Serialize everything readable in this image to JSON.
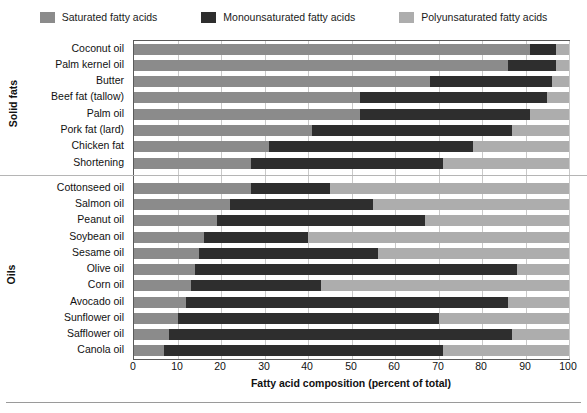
{
  "legend": {
    "position": "top",
    "items": [
      {
        "label": "Saturated fatty acids",
        "color": "#8b8b8b",
        "key": "saturated"
      },
      {
        "label": "Monounsaturated fatty acids",
        "color": "#2e2e2e",
        "key": "monounsaturated"
      },
      {
        "label": "Polyunsaturated fatty acids",
        "color": "#adadad",
        "key": "polyunsaturated"
      }
    ]
  },
  "groups": [
    {
      "name": "Solid fats",
      "count": 8
    },
    {
      "name": "Oils",
      "count": 11
    }
  ],
  "axis": {
    "x_title": "Fatty acid composition (percent of total)",
    "x_ticks": [
      0,
      10,
      20,
      30,
      40,
      50,
      60,
      70,
      80,
      90,
      100
    ],
    "x_min": 0,
    "x_max": 100
  },
  "chart_data": {
    "type": "bar",
    "orientation": "horizontal",
    "stacked": true,
    "title": "",
    "xlabel": "Fatty acid composition (percent of total)",
    "ylabel": "",
    "xlim": [
      0,
      100
    ],
    "grid": true,
    "legend_position": "top",
    "categories": [
      "Coconut oil",
      "Palm kernel oil",
      "Butter",
      "Beef fat (tallow)",
      "Palm oil",
      "Pork fat (lard)",
      "Chicken fat",
      "Shortening",
      "Cottonseed oil",
      "Salmon oil",
      "Peanut oil",
      "Soybean oil",
      "Sesame oil",
      "Olive oil",
      "Corn oil",
      "Avocado oil",
      "Sunflower oil",
      "Safflower oil",
      "Canola oil"
    ],
    "category_groups": [
      "Solid fats",
      "Solid fats",
      "Solid fats",
      "Solid fats",
      "Solid fats",
      "Solid fats",
      "Solid fats",
      "Solid fats",
      "Oils",
      "Oils",
      "Oils",
      "Oils",
      "Oils",
      "Oils",
      "Oils",
      "Oils",
      "Oils",
      "Oils",
      "Oils"
    ],
    "series": [
      {
        "name": "Saturated fatty acids",
        "color": "#8b8b8b",
        "values": [
          91,
          86,
          68,
          52,
          52,
          41,
          31,
          27,
          27,
          22,
          19,
          16,
          15,
          14,
          13,
          12,
          10,
          8,
          7
        ]
      },
      {
        "name": "Monounsaturated fatty acids",
        "color": "#2e2e2e",
        "values": [
          6,
          11,
          28,
          43,
          39,
          46,
          47,
          44,
          18,
          33,
          48,
          24,
          41,
          74,
          30,
          74,
          60,
          79,
          64
        ]
      },
      {
        "name": "Polyunsaturated fatty acids",
        "color": "#adadad",
        "values": [
          3,
          3,
          4,
          5,
          9,
          13,
          22,
          29,
          55,
          45,
          33,
          60,
          44,
          12,
          57,
          14,
          30,
          13,
          29
        ]
      }
    ],
    "cumulative_boundaries": {
      "Coconut oil": [
        91,
        97,
        100
      ],
      "Palm kernel oil": [
        86,
        97,
        100
      ],
      "Butter": [
        68,
        96,
        100
      ],
      "Beef fat (tallow)": [
        52,
        95,
        100
      ],
      "Palm oil": [
        52,
        91,
        100
      ],
      "Pork fat (lard)": [
        41,
        87,
        100
      ],
      "Chicken fat": [
        31,
        78,
        100
      ],
      "Shortening": [
        27,
        71,
        100
      ],
      "Cottonseed oil": [
        27,
        45,
        100
      ],
      "Salmon oil": [
        22,
        55,
        100
      ],
      "Peanut oil": [
        19,
        67,
        100
      ],
      "Soybean oil": [
        16,
        40,
        100
      ],
      "Sesame oil": [
        15,
        56,
        100
      ],
      "Olive oil": [
        14,
        88,
        100
      ],
      "Corn oil": [
        13,
        43,
        100
      ],
      "Avocado oil": [
        12,
        86,
        100
      ],
      "Sunflower oil": [
        10,
        70,
        100
      ],
      "Safflower oil": [
        8,
        87,
        100
      ],
      "Canola oil": [
        7,
        71,
        100
      ]
    }
  }
}
